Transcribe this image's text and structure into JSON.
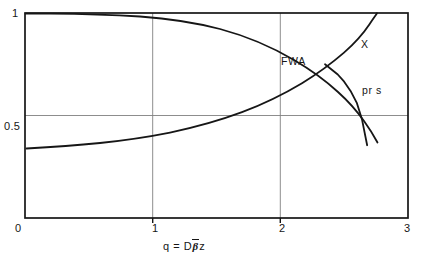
{
  "figure": {
    "background": "#ffffff",
    "ink_color": "#161616",
    "grid_color": "#808080"
  },
  "chart_data": {
    "type": "line",
    "title": "",
    "xlabel": "q = Dβ̄z",
    "ylabel": "",
    "xlim": [
      0,
      3
    ],
    "ylim": [
      0,
      1
    ],
    "xticks": [
      "0",
      "1",
      "2",
      "3"
    ],
    "xtick_values": [
      0,
      1,
      2,
      3
    ],
    "yticks": [
      "0.5",
      "1"
    ],
    "ytick_values": [
      0.5,
      1
    ],
    "grid": true,
    "gridlines": {
      "vertical": [
        1,
        2
      ],
      "horizontal": [
        0.5
      ]
    },
    "legend": "inline-annotations",
    "annotations": [
      {
        "text": "FWA",
        "x": 2.0,
        "y": 0.79
      },
      {
        "text": "X",
        "x": 2.63,
        "y": 0.86
      },
      {
        "text": "pr s",
        "x": 2.64,
        "y": 0.64
      }
    ],
    "series": [
      {
        "name": "FWA",
        "label": "FWA",
        "x": [
          0.0,
          0.2,
          0.4,
          0.6,
          0.8,
          1.0,
          1.2,
          1.4,
          1.6,
          1.8,
          2.0,
          2.2,
          2.35,
          2.5,
          2.6,
          2.68
        ],
        "values": [
          1.0,
          1.0,
          0.998,
          0.995,
          0.99,
          0.982,
          0.968,
          0.948,
          0.92,
          0.884,
          0.84,
          0.79,
          0.75,
          0.7,
          0.64,
          0.545
        ]
      },
      {
        "name": "X",
        "label": "X",
        "x": [
          0.05,
          0.3,
          0.6,
          0.9,
          1.2,
          1.5,
          1.75,
          2.0,
          2.2,
          2.35,
          2.45,
          2.55,
          2.65,
          2.72
        ],
        "values": [
          0.39,
          0.4,
          0.415,
          0.435,
          0.462,
          0.5,
          0.54,
          0.593,
          0.655,
          0.715,
          0.772,
          0.85,
          0.945,
          1.0
        ]
      },
      {
        "name": "prs",
        "label": "pr s",
        "x": [
          2.35,
          2.45,
          2.5,
          2.55,
          2.6,
          2.64,
          2.68
        ],
        "values": [
          0.75,
          0.7,
          0.665,
          0.62,
          0.56,
          0.48,
          0.355
        ]
      }
    ]
  }
}
